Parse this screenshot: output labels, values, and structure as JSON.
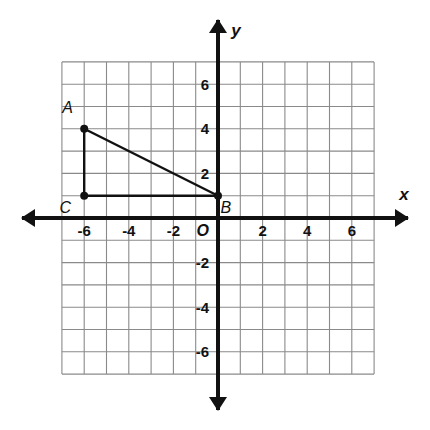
{
  "chart_data": {
    "type": "scatter",
    "title": "",
    "xlabel": "x",
    "ylabel": "y",
    "xlim": [
      -7,
      7
    ],
    "ylim": [
      -7,
      7
    ],
    "grid": true,
    "grid_step": 1,
    "legend": "none",
    "origin_label": "O",
    "x_tick_labels": [
      "-6",
      "-4",
      "-2",
      "2",
      "4",
      "6"
    ],
    "x_tick_values": [
      -6,
      -4,
      -2,
      2,
      4,
      6
    ],
    "y_tick_labels": [
      "6",
      "4",
      "2",
      "-2",
      "-4",
      "-6"
    ],
    "y_tick_values": [
      6,
      4,
      2,
      -2,
      -4,
      -6
    ],
    "points": [
      {
        "label": "A",
        "x": -6,
        "y": 4,
        "label_dx": -0.75,
        "label_dy": 0.95
      },
      {
        "label": "B",
        "x": 0,
        "y": 1,
        "label_dx": 0.35,
        "label_dy": -0.55
      },
      {
        "label": "C",
        "x": -6,
        "y": 1,
        "label_dx": -0.85,
        "label_dy": -0.55
      }
    ],
    "segments": [
      {
        "name": "leg-AC",
        "from": "A",
        "to": "C"
      },
      {
        "name": "leg-CB",
        "from": "C",
        "to": "B"
      },
      {
        "name": "hypotenuse-AB",
        "from": "A",
        "to": "B"
      }
    ],
    "shape": "right triangle ABC with right angle at C",
    "colors": {
      "grid": "#8a8a8a",
      "axis": "#111111",
      "shape": "#111111",
      "background": "#ffffff"
    }
  }
}
